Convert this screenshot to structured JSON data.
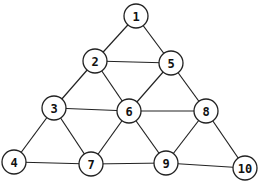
{
  "diagram": {
    "type": "graph",
    "node_radius": 12,
    "nodes": [
      {
        "id": "1",
        "label": "1",
        "x": 136,
        "y": 16
      },
      {
        "id": "2",
        "label": "2",
        "x": 95,
        "y": 61
      },
      {
        "id": "5",
        "label": "5",
        "x": 171,
        "y": 63
      },
      {
        "id": "3",
        "label": "3",
        "x": 54,
        "y": 108
      },
      {
        "id": "6",
        "label": "6",
        "x": 129,
        "y": 111
      },
      {
        "id": "8",
        "label": "8",
        "x": 206,
        "y": 111
      },
      {
        "id": "4",
        "label": "4",
        "x": 14,
        "y": 162
      },
      {
        "id": "7",
        "label": "7",
        "x": 91,
        "y": 164
      },
      {
        "id": "9",
        "label": "9",
        "x": 166,
        "y": 163
      },
      {
        "id": "10",
        "label": "10",
        "x": 245,
        "y": 168
      }
    ],
    "edges": [
      [
        "1",
        "2"
      ],
      [
        "1",
        "5"
      ],
      [
        "2",
        "5"
      ],
      [
        "2",
        "3"
      ],
      [
        "2",
        "6"
      ],
      [
        "5",
        "6"
      ],
      [
        "5",
        "8"
      ],
      [
        "3",
        "6"
      ],
      [
        "6",
        "8"
      ],
      [
        "3",
        "4"
      ],
      [
        "3",
        "7"
      ],
      [
        "6",
        "7"
      ],
      [
        "6",
        "9"
      ],
      [
        "8",
        "9"
      ],
      [
        "8",
        "10"
      ],
      [
        "4",
        "7"
      ],
      [
        "7",
        "9"
      ],
      [
        "9",
        "10"
      ]
    ]
  }
}
